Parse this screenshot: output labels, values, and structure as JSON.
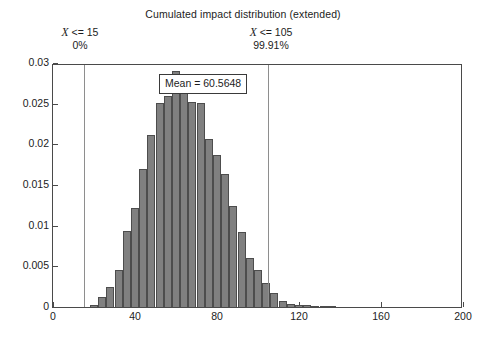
{
  "chart_data": {
    "type": "bar",
    "title": "Cumulated impact distribution (extended)",
    "xlabel": "",
    "ylabel": "",
    "xlim": [
      0,
      200
    ],
    "ylim": [
      0,
      0.03
    ],
    "grid": false,
    "legend": null,
    "bin_width": 4,
    "xticks": [
      0,
      40,
      80,
      120,
      160,
      200
    ],
    "xtick_labels": [
      "0",
      "40",
      "80",
      "120",
      "160",
      "200"
    ],
    "yticks": [
      0,
      0.005,
      0.01,
      0.015,
      0.02,
      0.025,
      0.03
    ],
    "ytick_labels": [
      "0",
      "0.005",
      "0.01",
      "0.015",
      "0.02",
      "0.025",
      "0.03"
    ],
    "bin_centers": [
      20,
      24,
      28,
      32,
      36,
      40,
      44,
      48,
      52,
      56,
      60,
      64,
      68,
      72,
      76,
      80,
      84,
      88,
      92,
      96,
      100,
      104,
      108,
      112,
      116,
      120,
      124,
      128,
      132,
      136
    ],
    "values": [
      0.0003,
      0.0012,
      0.0024,
      0.0045,
      0.0093,
      0.0122,
      0.017,
      0.0212,
      0.0251,
      0.026,
      0.029,
      0.0273,
      0.0252,
      0.0251,
      0.0206,
      0.0187,
      0.0163,
      0.0124,
      0.0092,
      0.006,
      0.0046,
      0.0029,
      0.0017,
      0.0008,
      0.0004,
      0.00025,
      0.0002,
      0.00015,
      0.0001,
      5e-05
    ],
    "annotations": [
      {
        "name": "left-percentile",
        "x": 15,
        "label": "X <= 15",
        "var": "X",
        "op": "<= 15",
        "value": "0%"
      },
      {
        "name": "right-percentile",
        "x": 105,
        "label": "X <= 105",
        "var": "X",
        "op": "<= 105",
        "value": "99.91%"
      },
      {
        "name": "mean-label",
        "text": "Mean = 60.5648",
        "mean": 60.5648
      }
    ],
    "colors": {
      "bar_fill": "#808080",
      "bar_edge": "#4d4d4d",
      "axis": "#4a4a4a",
      "marker_line": "#8e8e8e",
      "background": "#ffffff",
      "text": "#1c1c1c"
    }
  }
}
